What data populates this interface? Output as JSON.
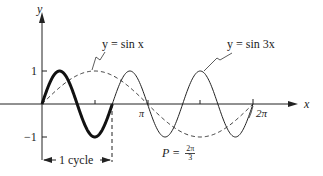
{
  "chart_data": {
    "type": "line",
    "title": "",
    "xlabel": "x",
    "ylabel": "y",
    "x_ticks": [
      "π",
      "2π"
    ],
    "y_ticks": [
      "1",
      "−1"
    ],
    "xlim": [
      0,
      6.2832
    ],
    "ylim": [
      -1,
      1
    ],
    "grid": false,
    "legend": "inline annotations",
    "series": [
      {
        "name": "y = sin x",
        "style": "dashed",
        "function": "sin(x)",
        "x": [
          0,
          0.7854,
          1.5708,
          2.3562,
          3.1416,
          3.927,
          4.7124,
          5.4978,
          6.2832
        ],
        "values": [
          0,
          0.707,
          1,
          0.707,
          0,
          -0.707,
          -1,
          -0.707,
          0
        ]
      },
      {
        "name": "y = sin 3x",
        "style": "solid (first cycle bold)",
        "function": "sin(3x)",
        "x": [
          0,
          0.5236,
          1.0472,
          1.5708,
          2.0944,
          2.618,
          3.1416,
          3.6652,
          4.1888,
          4.7124,
          5.236,
          5.7596,
          6.2832
        ],
        "values": [
          0,
          1,
          0,
          -1,
          0,
          1,
          0,
          -1,
          0,
          1,
          0,
          -1,
          0
        ]
      }
    ],
    "annotations": [
      "y = sin x",
      "y = sin 3x",
      "1 cycle",
      "P = 2π/3"
    ]
  },
  "labels": {
    "y_axis": "y",
    "x_axis": "x",
    "tick_one": "1",
    "tick_neg_one": "−1",
    "tick_pi": "π",
    "tick_two_pi": "2π",
    "sin_x_label": "y = sin x",
    "sin_3x_label": "y = sin 3x",
    "cycle_label": "1 cycle",
    "period_prefix": "P = ",
    "period_num": "2π",
    "period_den": "3"
  },
  "colors": {
    "ink": "#222222",
    "background": "#ffffff"
  }
}
